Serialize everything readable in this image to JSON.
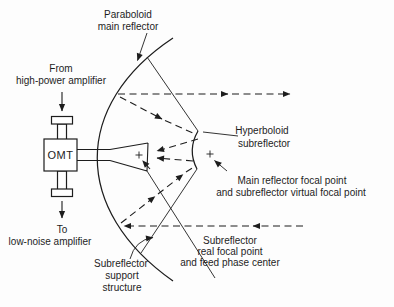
{
  "diagram": {
    "labels": {
      "paraboloid": [
        "Paraboloid",
        "main reflector"
      ],
      "from_amplifier": [
        "From",
        "high-power amplifier"
      ],
      "omt": "OMT",
      "to_amplifier": [
        "To",
        "low-noise amplifier"
      ],
      "hyperboloid": [
        "Hyperboloid",
        "subreflector"
      ],
      "main_focal": [
        "Main reflector focal point",
        "and subreflector virtual focal point"
      ],
      "sub_focal": [
        "Subreflector",
        "real focal point",
        "and feed phase center"
      ],
      "support": [
        "Subreflector",
        "support",
        "structure"
      ]
    },
    "colors": {
      "ink": "#1d1d1d",
      "background": "#fdfdfd"
    }
  }
}
